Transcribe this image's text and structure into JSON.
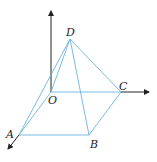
{
  "diagram": {
    "type": "pyramid-3d-axes",
    "colors": {
      "axis": "#222222",
      "edge": "#6ab4dc"
    },
    "points": {
      "O": {
        "label": "O",
        "x": 51,
        "y": 92
      },
      "A": {
        "label": "A",
        "x": 19,
        "y": 135
      },
      "B": {
        "label": "B",
        "x": 89,
        "y": 135
      },
      "C": {
        "label": "C",
        "x": 121,
        "y": 92
      },
      "D": {
        "label": "D",
        "x": 70,
        "y": 39
      }
    },
    "edges": [
      "OA",
      "AB",
      "BC",
      "OC",
      "DA",
      "DB",
      "DC",
      "DO"
    ],
    "axes": [
      "z-up from O",
      "y-right through C",
      "x-down-left through A"
    ]
  }
}
